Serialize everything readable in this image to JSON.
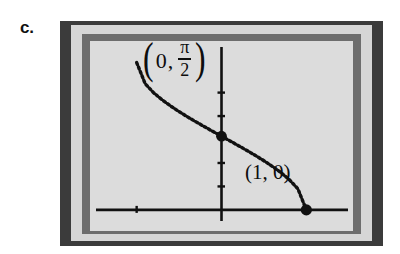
{
  "figure": {
    "part_label": "c.",
    "background_color": "#ffffff",
    "frame": {
      "outer_color": "#3b3b3b",
      "mat_color": "#d6d6d6",
      "inner_color": "#6d6d6d",
      "plot_background_color": "#dcdcdc"
    }
  },
  "annotations": {
    "y_intercept": {
      "open_paren": "(",
      "x_value": "0",
      "comma": ",",
      "numerator": "π",
      "denominator": "2",
      "close_paren": ")"
    },
    "x_intercept": {
      "text": "(1, 0)"
    }
  },
  "chart_data": {
    "type": "line",
    "title": "",
    "xlabel": "",
    "ylabel": "",
    "curve_name": "arccos(x)",
    "line_style": "dotted",
    "line_color": "#111111",
    "axis_color": "#111111",
    "grid": false,
    "legend": null,
    "xlim": [
      -1.55,
      1.55
    ],
    "ylim": [
      -0.45,
      3.6
    ],
    "x": [
      -1.0,
      -0.9,
      -0.8,
      -0.7,
      -0.6,
      -0.5,
      -0.4,
      -0.3,
      -0.2,
      -0.1,
      0.0,
      0.1,
      0.2,
      0.3,
      0.4,
      0.5,
      0.6,
      0.7,
      0.8,
      0.9,
      1.0
    ],
    "y": [
      3.1416,
      2.6906,
      2.4981,
      2.3462,
      2.2143,
      2.0944,
      1.9823,
      1.8755,
      1.7722,
      1.671,
      1.5708,
      1.4706,
      1.3694,
      1.2661,
      1.1593,
      1.0472,
      0.9273,
      0.7954,
      0.6435,
      0.451,
      0.0
    ],
    "points": [
      {
        "name": "y-intercept-dot",
        "x": 0,
        "y": 1.5708,
        "label": "(0, π/2)"
      },
      {
        "name": "x-intercept-dot",
        "x": 1,
        "y": 0,
        "label": "(1, 0)"
      }
    ],
    "y_axis_ticks": [
      0.5,
      1.0,
      2.0,
      2.5
    ],
    "x_axis_ticks": [
      -1.0
    ]
  }
}
